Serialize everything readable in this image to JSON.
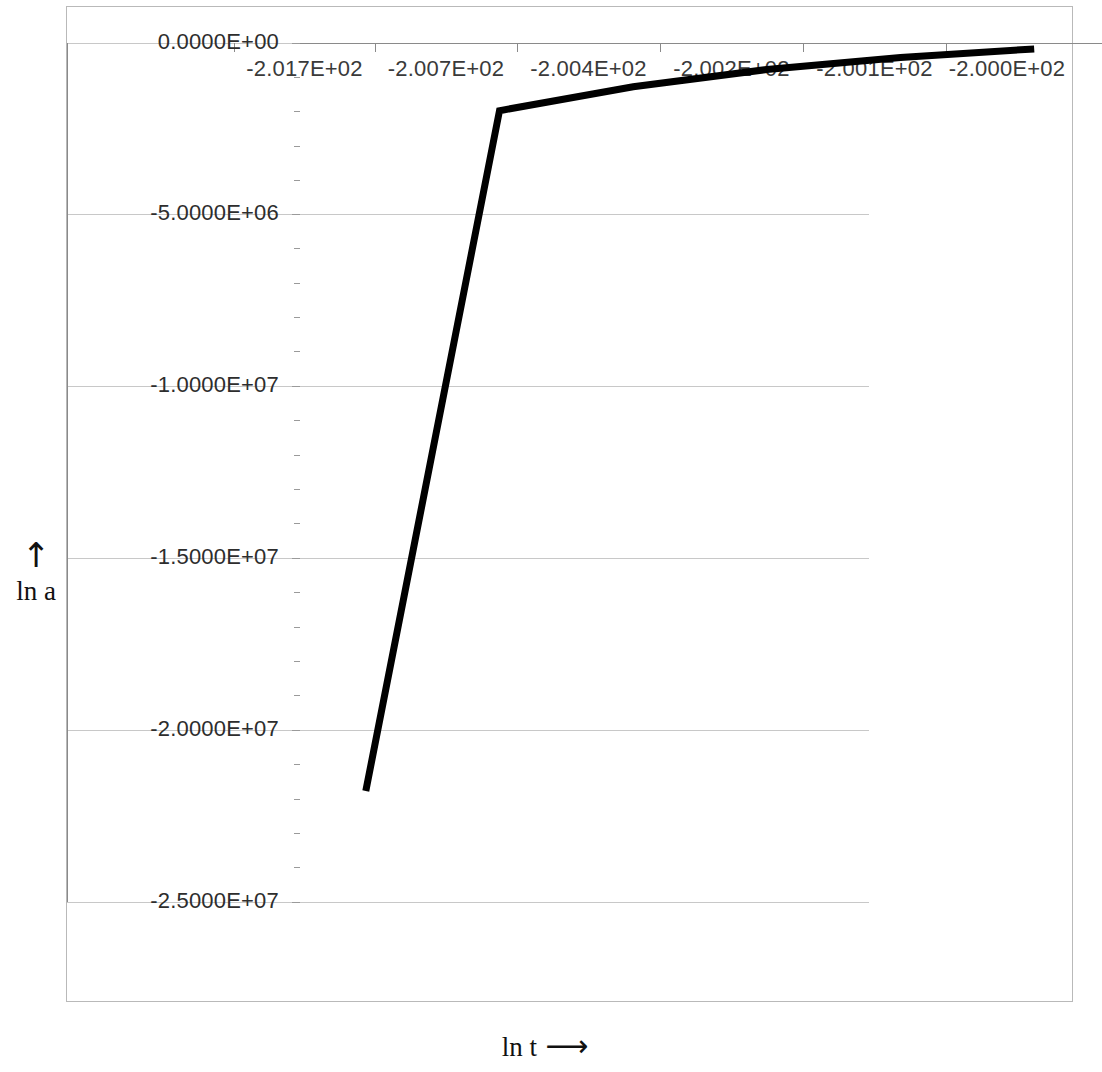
{
  "chart_data": {
    "type": "line",
    "title": "",
    "subtitle": "",
    "xlabel": "ln t",
    "xlabel_arrow": "⟶",
    "ylabel": "ln a",
    "ylabel_arrow": "↑",
    "categories": [
      "-2.017E+02",
      "-2.007E+02",
      "-2.004E+02",
      "-2.002E+02",
      "-2.001E+02",
      "-2.000E+02"
    ],
    "x_values": [
      -201.7,
      -200.7,
      -200.4,
      -200.2,
      -200.1,
      -200.0
    ],
    "series": [
      {
        "name": "ln a",
        "values": [
          -21800000,
          -2000000,
          -1300000,
          -800000,
          -450000,
          -200000
        ],
        "color": "#000000",
        "line_width": 7
      }
    ],
    "y_tick_labels": [
      "0.0000E+00",
      "-5.0000E+06",
      "-1.0000E+07",
      "-1.5000E+07",
      "-2.0000E+07",
      "-2.5000E+07"
    ],
    "y_tick_values": [
      0,
      -5000000,
      -10000000,
      -15000000,
      -20000000,
      -25000000
    ],
    "ylim": [
      -25000000,
      0
    ],
    "y_minor_ticks_per_interval": 5,
    "x_tick_labels_position": "top",
    "grid": "horizontal",
    "legend": "none",
    "plot_border": "top-left",
    "gridline_color": "#c8c8c8",
    "axis_color": "#8a8a8a",
    "frame_color": "#b9b9b9",
    "background": "#ffffff"
  }
}
